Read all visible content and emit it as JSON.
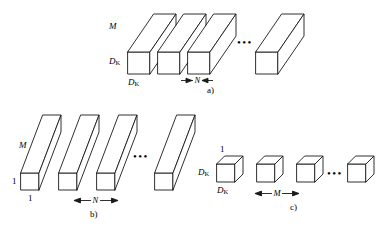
{
  "figure": {
    "stroke_color": "#1a1a1a",
    "fill_color": "#ffffff",
    "background": "#ffffff",
    "ellipsis": "•••"
  },
  "panels": [
    {
      "id": "a",
      "caption": "a)",
      "description": "standard convolution filters",
      "block_count_shown": 3,
      "trailing_block": 1,
      "labels": {
        "depth": "M",
        "height": "D",
        "height_sub": "K",
        "width": "D",
        "width_sub": "K"
      },
      "dimension": {
        "label": "N",
        "arrow_direction": "inward"
      }
    },
    {
      "id": "b",
      "caption": "b)",
      "description": "depthwise convolutional filters",
      "block_count_shown": 3,
      "trailing_block": 1,
      "labels": {
        "depth": "M",
        "height": "1",
        "width": "1"
      },
      "dimension": {
        "label": "N",
        "arrow_direction": "outward"
      }
    },
    {
      "id": "c",
      "caption": "c)",
      "description": "pointwise convolution filters",
      "block_count_shown": 3,
      "trailing_block": 1,
      "labels": {
        "depth": "1",
        "height": "D",
        "height_sub": "K",
        "width": "D",
        "width_sub": "K"
      },
      "dimension": {
        "label": "M",
        "arrow_direction": "outward"
      }
    }
  ]
}
